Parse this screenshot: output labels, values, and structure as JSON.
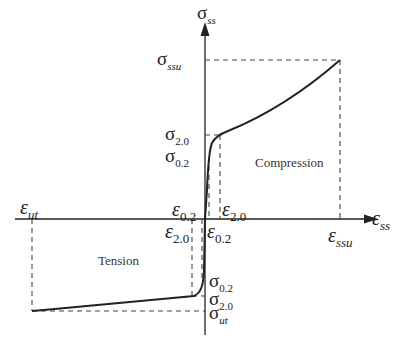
{
  "diagram": {
    "axes": {
      "y_axis": {
        "symbol": "σ",
        "subscript": "ss"
      },
      "x_axis": {
        "symbol": "ε",
        "subscript": "ss"
      }
    },
    "regions": {
      "compression": "Compression",
      "tension": "Tension"
    },
    "labels": {
      "sigma_ssu": {
        "symbol": "σ",
        "subscript": "ssu"
      },
      "sigma_20_c": {
        "symbol": "σ",
        "subscript": "2.0"
      },
      "sigma_02_c": {
        "symbol": "σ",
        "subscript": "0.2"
      },
      "sigma_02_t": {
        "symbol": "σ",
        "subscript": "0.2"
      },
      "sigma_20_t": {
        "symbol": "σ",
        "subscript": "2.0"
      },
      "sigma_ut": {
        "symbol": "σ",
        "subscript": "ut"
      },
      "eps_ut": {
        "symbol": "ε",
        "subscript": "ut"
      },
      "eps_02_t": {
        "symbol": "ε",
        "subscript": "0.2"
      },
      "eps_20_t": {
        "symbol": "ε",
        "subscript": "2.0"
      },
      "eps_20_c": {
        "symbol": "ε",
        "subscript": "2.0"
      },
      "eps_02_c": {
        "symbol": "ε",
        "subscript": "0.2"
      },
      "eps_ssu": {
        "symbol": "ε",
        "subscript": "ssu"
      }
    },
    "colors": {
      "line": "#222222",
      "dash": "#444444",
      "background": "#ffffff"
    }
  }
}
